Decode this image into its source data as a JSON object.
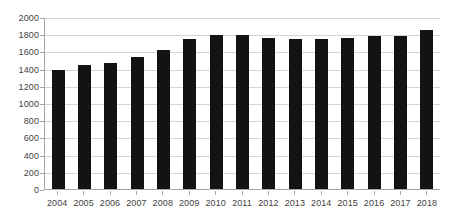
{
  "chart_data": {
    "type": "bar",
    "title": "",
    "subtitle": "",
    "xlabel": "",
    "ylabel": "",
    "categories": [
      "2004",
      "2005",
      "2006",
      "2007",
      "2008",
      "2009",
      "2010",
      "2011",
      "2012",
      "2013",
      "2014",
      "2015",
      "2016",
      "2017",
      "2018"
    ],
    "values": [
      1380,
      1440,
      1470,
      1540,
      1620,
      1740,
      1790,
      1790,
      1760,
      1740,
      1740,
      1755,
      1775,
      1780,
      1845
    ],
    "series": [
      {
        "name": "Series 1",
        "values": [
          1380,
          1440,
          1470,
          1540,
          1620,
          1740,
          1790,
          1790,
          1760,
          1740,
          1740,
          1755,
          1775,
          1780,
          1845
        ]
      }
    ],
    "ylim": [
      0,
      2000
    ],
    "yticks": [
      0,
      200,
      400,
      600,
      800,
      1000,
      1200,
      1400,
      1600,
      1800,
      2000
    ],
    "ytick_labels": [
      "0",
      "200",
      "400",
      "600",
      "800",
      "1000",
      "1200",
      "1400",
      "1600",
      "1800",
      "2000"
    ],
    "grid": true,
    "grid_axis": "y",
    "legend": false,
    "legend_position": "none",
    "bar_color": "#131313",
    "grid_color": "#d4d4d4",
    "axis_color": "#a6a6a6",
    "tick_label_color": "#3f3f3f",
    "background": "#ffffff"
  }
}
